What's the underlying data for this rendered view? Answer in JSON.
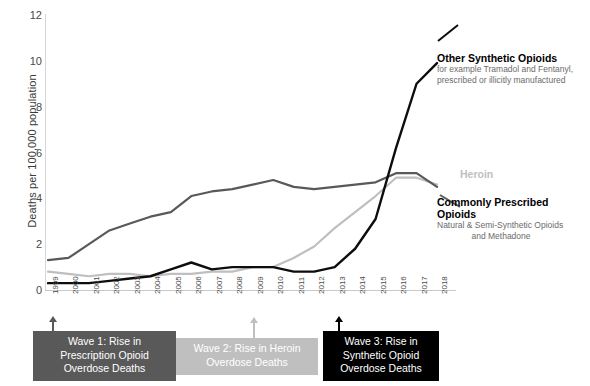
{
  "chart_data": {
    "type": "line",
    "title": "",
    "subtitle": "",
    "xlabel": "",
    "ylabel": "Deaths per 100,000 population",
    "xlim": [
      1999,
      2018
    ],
    "ylim": [
      0,
      12
    ],
    "yticks": [
      0,
      2,
      4,
      6,
      8,
      10,
      12
    ],
    "grid": false,
    "legend_position": "right-inline-annotations",
    "categories": [
      1999,
      2000,
      2001,
      2002,
      2003,
      2004,
      2005,
      2006,
      2007,
      2008,
      2009,
      2010,
      2011,
      2012,
      2013,
      2014,
      2015,
      2016,
      2017,
      2018
    ],
    "series": [
      {
        "name": "Commonly Prescribed Opioids",
        "color": "#595959",
        "values": [
          1.3,
          1.4,
          2.0,
          2.6,
          2.9,
          3.2,
          3.4,
          4.1,
          4.3,
          4.4,
          4.6,
          4.8,
          4.5,
          4.4,
          4.5,
          4.6,
          4.7,
          5.1,
          5.1,
          4.5
        ]
      },
      {
        "name": "Heroin",
        "color": "#bfbfbf",
        "values": [
          0.8,
          0.7,
          0.6,
          0.7,
          0.7,
          0.6,
          0.7,
          0.7,
          0.8,
          0.8,
          1.0,
          1.0,
          1.4,
          1.9,
          2.7,
          3.4,
          4.1,
          4.9,
          4.9,
          4.6
        ]
      },
      {
        "name": "Other Synthetic Opioids",
        "color": "#0d0d0d",
        "values": [
          0.3,
          0.3,
          0.3,
          0.4,
          0.5,
          0.6,
          0.9,
          1.2,
          0.9,
          1.0,
          1.0,
          1.0,
          0.8,
          0.8,
          1.0,
          1.8,
          3.1,
          6.2,
          9.0,
          9.9
        ]
      }
    ]
  },
  "y_axis": {
    "title": "Deaths per 100,000 population",
    "ticks": [
      "0",
      "2",
      "4",
      "6",
      "8",
      "10",
      "12"
    ]
  },
  "x_axis": {
    "ticks": [
      "1999",
      "2000",
      "2001",
      "2002",
      "2003",
      "2004",
      "2005",
      "2006",
      "2007",
      "2008",
      "2009",
      "2010",
      "2011",
      "2012",
      "2013",
      "2014",
      "2015",
      "2016",
      "2017",
      "2018"
    ]
  },
  "annotations": [
    {
      "id": "other-synthetic-opioids",
      "title": "Other Synthetic Opioids",
      "sub": "for example Tramadol and Fentanyl,\nprescribed or illicitly manufactured",
      "sub_line1": "for example Tramadol and Fentanyl,",
      "sub_line2": "prescribed or illicitly manufactured",
      "title_color": "#000000"
    },
    {
      "id": "heroin",
      "title": "Heroin",
      "title_color": "#bfbfbf"
    },
    {
      "id": "commonly-prescribed-opioids",
      "title": "Commonly Prescribed Opioids",
      "sub_line1": "Natural & Semi-Synthetic Opioids",
      "sub_line2": "and Methadone",
      "title_color": "#000000"
    }
  ],
  "waves": [
    {
      "id": "wave-1",
      "line1": "Wave 1: Rise in",
      "line2": "Prescription Opioid",
      "line3": "Overdose Deaths",
      "bg": "#595959",
      "arrow_color": "#595959",
      "anchor_year": "1999"
    },
    {
      "id": "wave-2",
      "line1": "Wave 2: Rise in Heroin",
      "line2": "Overdose Deaths",
      "line3": "",
      "bg": "#bfbfbf",
      "arrow_color": "#bfbfbf",
      "anchor_year": "2010"
    },
    {
      "id": "wave-3",
      "line1": "Wave 3: Rise in",
      "line2": "Synthetic Opioid",
      "line3": "Overdose Deaths",
      "bg": "#000000",
      "arrow_color": "#000000",
      "anchor_year": "2013"
    }
  ]
}
